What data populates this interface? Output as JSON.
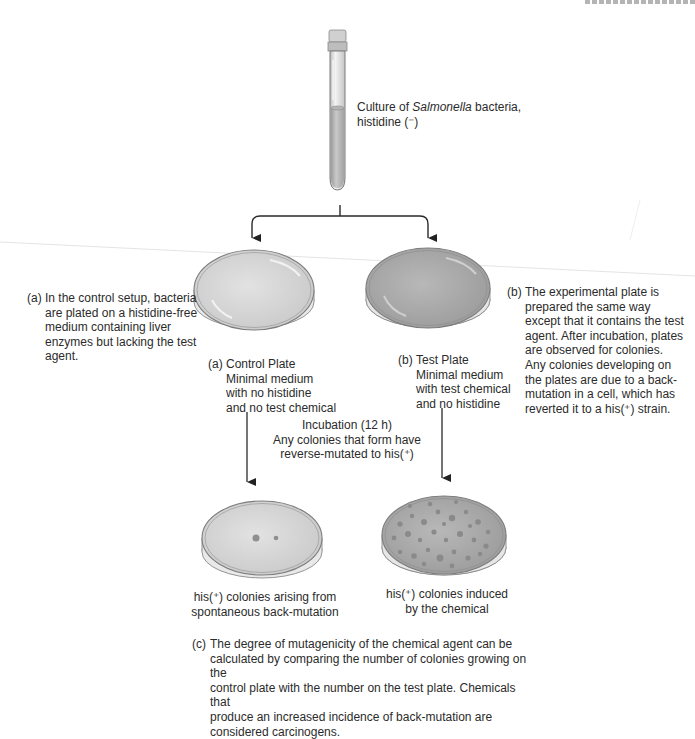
{
  "figure": {
    "tube": {
      "label_prefix": "Culture of ",
      "label_italic": "Salmonella",
      "label_suffix": " bacteria,",
      "label_line2": "histidine (⁻)"
    },
    "annotation_a": {
      "tag": "(a)",
      "lines": [
        "In the control setup, bacteria",
        "are plated on a histidine-free",
        "medium containing liver",
        "enzymes but lacking the test",
        "agent."
      ]
    },
    "annotation_b": {
      "tag": "(b)",
      "lines": [
        "The experimental plate is",
        "prepared the same way",
        "except that it contains the test",
        "agent. After incubation, plates",
        "are observed for colonies.",
        "Any colonies developing on",
        "the plates are due to a back-",
        "mutation in a cell, which has",
        "reverted it to a his(⁺) strain."
      ]
    },
    "control_plate": {
      "tag": "(a)",
      "title": "Control Plate",
      "lines": [
        "Minimal medium",
        "with no histidine",
        "and no test chemical"
      ]
    },
    "test_plate": {
      "tag": "(b)",
      "title": "Test Plate",
      "lines": [
        "Minimal medium",
        "with test chemical",
        "and no histidine"
      ]
    },
    "incubation": {
      "lines": [
        "Incubation (12 h)",
        "Any colonies that form have",
        "reverse-mutated to his(⁺)"
      ]
    },
    "result_control": {
      "lines": [
        "his(⁺) colonies arising from",
        "spontaneous back-mutation"
      ]
    },
    "result_test": {
      "lines": [
        "his(⁺) colonies induced",
        "by the chemical"
      ]
    },
    "annotation_c": {
      "tag": "(c)",
      "lines": [
        "The degree of mutagenicity of the chemical agent can be",
        "calculated by comparing the number of colonies growing on the",
        "control plate with the number on the test plate. Chemicals that",
        "produce an increased incidence of back-mutation are",
        "considered carcinogens."
      ]
    },
    "colors": {
      "line": "#2a2a2a",
      "agar_light": "#d4d4d4",
      "agar_dark": "#a9a9a9",
      "colony": "#8f8f8f"
    }
  }
}
